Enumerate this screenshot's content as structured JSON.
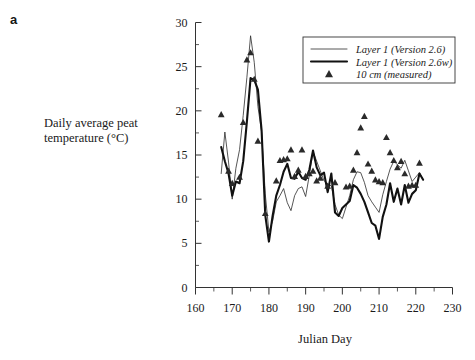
{
  "panel": {
    "label": "a"
  },
  "axes": {
    "y_title": "Daily average peat temperature (°C)",
    "y_title_line1": "Daily average peat",
    "y_title_line2": "temperature (°C)",
    "x_title": "Julian Day"
  },
  "legend": {
    "items": [
      {
        "label": "Layer 1 (Version 2.6)",
        "kind": "thin-line"
      },
      {
        "label": "Layer 1 (Version 2.6w)",
        "kind": "thick-line"
      },
      {
        "label": "10 cm (measured)",
        "kind": "triangle-marker"
      }
    ]
  },
  "colors": {
    "thin_line": "#2b2b2b",
    "thick_line": "#111111",
    "marker": "#2a2a2a",
    "axis": "#333333",
    "background": "#ffffff"
  },
  "chart_data": {
    "type": "line",
    "title": "",
    "xlabel": "Julian Day",
    "ylabel": "Daily average peat temperature (°C)",
    "xlim": [
      160,
      230
    ],
    "ylim": [
      0,
      30
    ],
    "xticks": [
      160,
      170,
      180,
      190,
      200,
      210,
      220,
      230
    ],
    "yticks": [
      0,
      5,
      10,
      15,
      20,
      25,
      30
    ],
    "x_minor_step": 5,
    "y_minor_step": 2.5,
    "grid": false,
    "legend_position": "top-right",
    "series": [
      {
        "name": "Layer 1 (Version 2.6)",
        "style": "thin-line",
        "x": [
          167,
          168,
          169,
          170,
          171,
          172,
          173,
          174,
          175,
          176,
          177,
          178,
          179,
          180,
          181,
          182,
          183,
          184,
          185,
          186,
          187,
          188,
          189,
          190,
          191,
          192,
          193,
          194,
          195,
          196,
          197,
          198,
          199,
          200,
          201,
          202,
          203,
          204,
          205,
          206,
          207,
          208,
          209,
          210,
          211,
          212,
          213,
          214,
          215,
          216,
          217,
          218,
          219,
          220,
          221,
          222
        ],
        "values": [
          12.9,
          17.6,
          14.2,
          10.0,
          13.5,
          15.6,
          19.5,
          23.8,
          28.5,
          25.5,
          20.5,
          17.6,
          10.6,
          6.3,
          7.5,
          9.7,
          10.4,
          11.2,
          9.6,
          8.7,
          10.4,
          11.2,
          11.4,
          10.3,
          12.7,
          15.4,
          14.3,
          13.2,
          12.1,
          11.7,
          11.5,
          9.4,
          8.2,
          7.8,
          9.1,
          10.4,
          12.2,
          13.1,
          13.0,
          11.9,
          10.4,
          9.7,
          9.1,
          8.5,
          10.5,
          12.0,
          13.4,
          14.3,
          13.9,
          13.5,
          14.4,
          13.2,
          12.0,
          12.5,
          13.0,
          12.2
        ]
      },
      {
        "name": "Layer 1 (Version 2.6w)",
        "style": "thick-line",
        "x": [
          167,
          168,
          169,
          170,
          171,
          172,
          173,
          174,
          175,
          176,
          177,
          178,
          179,
          180,
          181,
          182,
          183,
          184,
          185,
          186,
          187,
          188,
          189,
          190,
          191,
          192,
          193,
          194,
          195,
          196,
          197,
          198,
          199,
          200,
          201,
          202,
          203,
          204,
          205,
          206,
          207,
          208,
          209,
          210,
          211,
          212,
          213,
          214,
          215,
          216,
          217,
          218,
          219,
          220,
          221,
          222
        ],
        "values": [
          15.9,
          14.3,
          12.9,
          10.4,
          12.0,
          11.8,
          14.3,
          18.8,
          23.7,
          23.5,
          22.4,
          17.8,
          8.2,
          5.2,
          8.1,
          10.4,
          11.6,
          13.1,
          14.0,
          12.4,
          12.3,
          13.1,
          12.4,
          12.2,
          13.3,
          15.5,
          13.6,
          12.7,
          13.0,
          10.8,
          12.9,
          8.5,
          8.1,
          9.0,
          9.4,
          9.8,
          11.6,
          11.3,
          10.6,
          9.7,
          8.5,
          7.3,
          7.0,
          5.5,
          8.0,
          9.4,
          11.8,
          9.7,
          11.2,
          9.4,
          11.6,
          9.6,
          10.6,
          11.0,
          12.9,
          12.2
        ]
      }
    ],
    "markers": {
      "name": "10 cm (measured)",
      "style": "triangle",
      "x": [
        167,
        169,
        170,
        172,
        173,
        174,
        175,
        176,
        177,
        179,
        182,
        183,
        184,
        185,
        186,
        187,
        188,
        189,
        190,
        191,
        192,
        193,
        194,
        196,
        198,
        201,
        202,
        203,
        204,
        205,
        206,
        207,
        208,
        209,
        210,
        211,
        212,
        213,
        214,
        215,
        216,
        217,
        218,
        219,
        220,
        221
      ],
      "values": [
        19.6,
        13.2,
        11.8,
        12.5,
        18.7,
        25.8,
        26.6,
        23.6,
        16.6,
        8.4,
        12.1,
        14.4,
        14.5,
        14.6,
        15.6,
        12.6,
        13.3,
        15.6,
        12.6,
        12.9,
        13.2,
        12.1,
        12.4,
        11.5,
        11.9,
        11.4,
        11.5,
        13.3,
        15.3,
        18.1,
        19.4,
        14.0,
        13.2,
        12.2,
        12.0,
        11.9,
        17.0,
        15.3,
        14.4,
        13.6,
        14.3,
        12.9,
        11.5,
        11.6,
        11.6,
        14.1
      ]
    }
  }
}
